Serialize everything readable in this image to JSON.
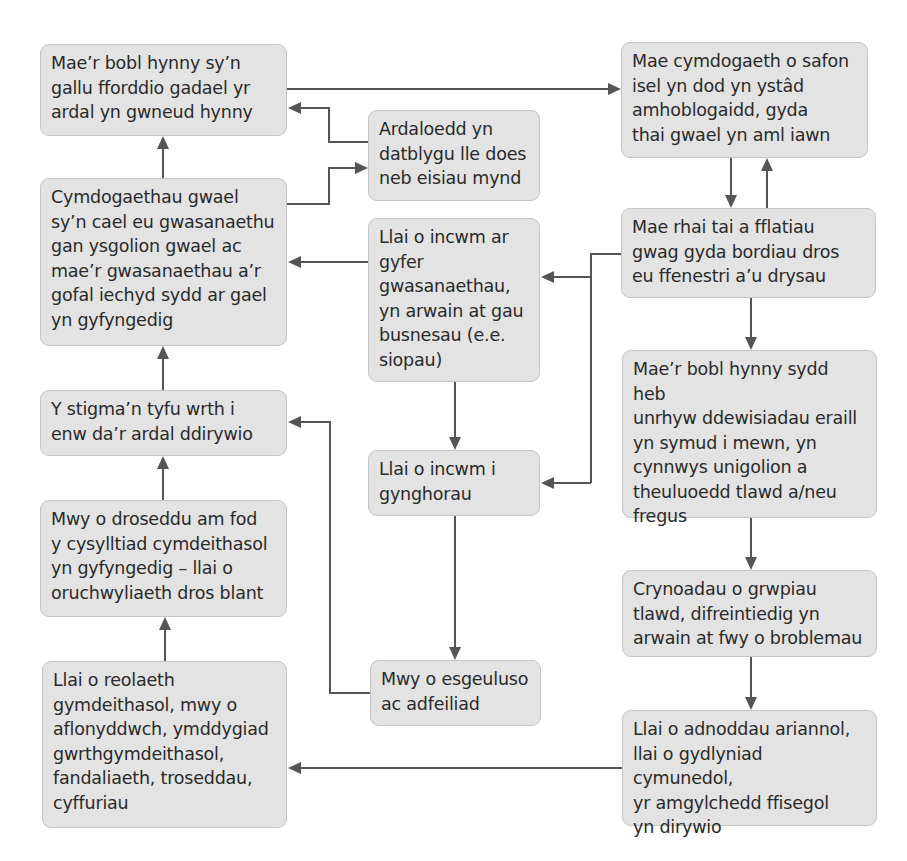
{
  "diagram": {
    "type": "flowchart",
    "title": "",
    "colors": {
      "box_fill": "#e3e3e3",
      "box_border": "#c4c4c4",
      "text": "#2a2a2a",
      "connector": "#555555",
      "background": "#ffffff"
    },
    "nodes": {
      "leavers": {
        "text": "Mae’r bobl hynny sy’n\ngallu fforddio gadael yr\nardal yn gwneud hynny"
      },
      "no_go_areas": {
        "text": "Ardaloedd yn\ndatblygu lle does\nneb eisiau mynd"
      },
      "low_quality_estate": {
        "text": "Mae cymdogaeth o safon\nisel yn dod yn ystâd\namhoblogaidd, gyda\nthai gwael yn aml iawn"
      },
      "poor_neighbourhoods": {
        "text": "Cymdogaethau gwael\nsy’n cael eu gwasanaethu\ngan ysgolion gwael ac\nmae’r gwasanaethau a’r\ngofal iechyd sydd ar gael\nyn gyfyngedig"
      },
      "less_income_services": {
        "text": "Llai o incwm ar\ngyfer\ngwasanaethau,\nyn arwain at gau\nbusnesau (e.e.\nsiopau)"
      },
      "boarded_homes": {
        "text": "Mae rhai tai a fflatiau\ngwag gyda bordiau dros\neu ffenestri a’u drysau"
      },
      "stigma": {
        "text": "Y stigma’n tyfu wrth i\nenw da’r ardal ddirywio"
      },
      "less_income_councils": {
        "text": "Llai o incwm i\ngynghorau"
      },
      "incomers": {
        "text": "Mae’r bobl hynny sydd heb\nunrhyw ddewisiadau eraill\nyn symud i mewn, yn\ncynnwys unigolion a\ntheuluoedd tlawd a/neu\nfregus"
      },
      "more_crime": {
        "text": "Mwy o droseddu am fod\ny cysylltiad cymdeithasol\nyn gyfyngedig – llai o\noruchwyliaeth dros blant"
      },
      "concentrations": {
        "text": "Crynoadau o grwpiau\ntlawd, difreintiedig yn\narwain at fwy o broblemau"
      },
      "less_social_control": {
        "text": "Llai o reolaeth\ngymdeithasol, mwy o\naflonyddwch, ymddygiad\ngwrthgymdeithasol,\nfandaliaeth, troseddau,\ncyffuriau"
      },
      "neglect": {
        "text": "Mwy o esgeuluso\nac adfeiliad"
      },
      "fewer_resources": {
        "text": "Llai o adnoddau ariannol,\nllai o gydlyniad cymunedol,\nyr amgylchedd ffisegol\nyn dirywio"
      }
    },
    "edges": [
      {
        "from": "leavers",
        "to": "low_quality_estate"
      },
      {
        "from": "no_go_areas",
        "to": "leavers"
      },
      {
        "from": "poor_neighbourhoods",
        "to": "leavers"
      },
      {
        "from": "poor_neighbourhoods",
        "to": "no_go_areas"
      },
      {
        "from": "low_quality_estate",
        "to": "boarded_homes"
      },
      {
        "from": "boarded_homes",
        "to": "low_quality_estate"
      },
      {
        "from": "boarded_homes",
        "to": "less_income_services"
      },
      {
        "from": "boarded_homes",
        "to": "less_income_councils"
      },
      {
        "from": "boarded_homes",
        "to": "incomers"
      },
      {
        "from": "less_income_services",
        "to": "poor_neighbourhoods"
      },
      {
        "from": "less_income_services",
        "to": "less_income_councils"
      },
      {
        "from": "less_income_councils",
        "to": "neglect"
      },
      {
        "from": "neglect",
        "to": "stigma"
      },
      {
        "from": "stigma",
        "to": "poor_neighbourhoods"
      },
      {
        "from": "more_crime",
        "to": "stigma"
      },
      {
        "from": "less_social_control",
        "to": "more_crime"
      },
      {
        "from": "incomers",
        "to": "concentrations"
      },
      {
        "from": "concentrations",
        "to": "fewer_resources"
      },
      {
        "from": "fewer_resources",
        "to": "less_social_control"
      }
    ]
  }
}
